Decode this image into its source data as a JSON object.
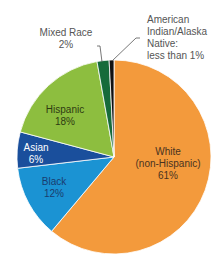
{
  "chart_data": {
    "type": "pie",
    "title": "",
    "start_angle_deg": 0,
    "direction": "clockwise",
    "slices": [
      {
        "label": "White (non-Hispanic)",
        "value": 61,
        "display": "61%",
        "color": "#F39A3C"
      },
      {
        "label": "Black",
        "value": 12,
        "display": "12%",
        "color": "#1B93D3"
      },
      {
        "label": "Asian",
        "value": 6,
        "display": "6%",
        "color": "#1A4F9C"
      },
      {
        "label": "Hispanic",
        "value": 18,
        "display": "18%",
        "color": "#8DBE3F"
      },
      {
        "label": "Mixed Race",
        "value": 2,
        "display": "2%",
        "color": "#166B3A"
      },
      {
        "label": "American Indian/Alaska Native",
        "value": 0.8,
        "display": "less than 1%",
        "color": "#111111"
      }
    ]
  },
  "labels": {
    "white": {
      "line1": "White",
      "line2": "(non-Hispanic)",
      "line3": "61%"
    },
    "black": {
      "line1": "Black",
      "line2": "12%"
    },
    "asian": {
      "line1": "Asian",
      "line2": "6%"
    },
    "hispanic": {
      "line1": "Hispanic",
      "line2": "18%"
    },
    "mixed": {
      "line1": "Mixed Race",
      "line2": "2%"
    },
    "aian": {
      "line1": "American",
      "line2": "Indian/Alaska",
      "line3": "Native:",
      "line4": "less than 1%"
    }
  }
}
